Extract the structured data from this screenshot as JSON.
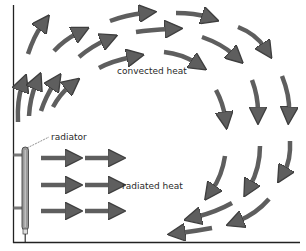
{
  "diagram": {
    "type": "room-heat-circulation",
    "labels": {
      "radiator": "radiator",
      "radiated_heat": "radiated heat",
      "convected_heat": "convected heat"
    },
    "colors": {
      "arrow_fill": "#5e5e5e",
      "arrow_stroke": "#3e3e3e",
      "wall": "#222222",
      "radiator": "#8a8a8a",
      "background": "#ffffff"
    },
    "radiated_arrows": [
      {
        "row": 1,
        "y": 158,
        "x": [
          [
            40,
            76
          ],
          [
            85,
            119
          ]
        ]
      },
      {
        "row": 2,
        "y": 185,
        "x": [
          [
            40,
            76
          ],
          [
            85,
            119
          ]
        ]
      },
      {
        "row": 3,
        "y": 211,
        "x": [
          [
            40,
            76
          ],
          [
            85,
            119
          ]
        ]
      }
    ]
  }
}
